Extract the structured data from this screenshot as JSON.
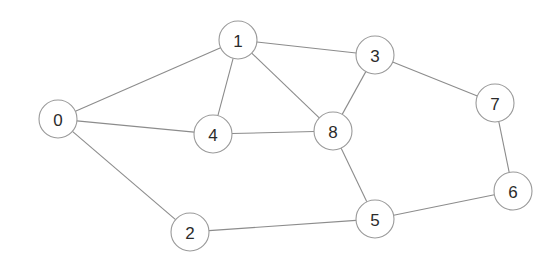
{
  "graph": {
    "title": "undirected-node-link-graph",
    "background_color": "#ffffff",
    "edge_color": "#8c8c8c",
    "node_fill_color": "#ffffff",
    "node_stroke_color": "#9a9a9a",
    "node_label_color": "#2b2b2b",
    "node_radius": 19,
    "edge_width": 1.1,
    "node_count": 9,
    "edge_count": 13,
    "nodes": [
      {
        "id": "0",
        "label": "0",
        "x": 58,
        "y": 119
      },
      {
        "id": "1",
        "label": "1",
        "x": 238,
        "y": 40
      },
      {
        "id": "2",
        "label": "2",
        "x": 190,
        "y": 232
      },
      {
        "id": "3",
        "label": "3",
        "x": 375,
        "y": 55
      },
      {
        "id": "4",
        "label": "4",
        "x": 213,
        "y": 134
      },
      {
        "id": "5",
        "label": "5",
        "x": 375,
        "y": 219
      },
      {
        "id": "6",
        "label": "6",
        "x": 513,
        "y": 191
      },
      {
        "id": "7",
        "label": "7",
        "x": 495,
        "y": 103
      },
      {
        "id": "8",
        "label": "8",
        "x": 333,
        "y": 131
      }
    ],
    "edges": [
      {
        "source": "0",
        "target": "1"
      },
      {
        "source": "0",
        "target": "4"
      },
      {
        "source": "0",
        "target": "2"
      },
      {
        "source": "1",
        "target": "3"
      },
      {
        "source": "1",
        "target": "4"
      },
      {
        "source": "1",
        "target": "8"
      },
      {
        "source": "3",
        "target": "7"
      },
      {
        "source": "3",
        "target": "8"
      },
      {
        "source": "4",
        "target": "8"
      },
      {
        "source": "5",
        "target": "8"
      },
      {
        "source": "5",
        "target": "2"
      },
      {
        "source": "5",
        "target": "6"
      },
      {
        "source": "6",
        "target": "7"
      }
    ]
  }
}
